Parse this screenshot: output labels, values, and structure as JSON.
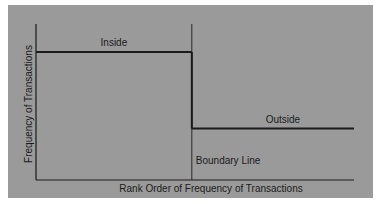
{
  "chart_data": {
    "type": "line",
    "style": "step",
    "title": "",
    "xlabel": "Rank Order of Frequency of Transactions",
    "ylabel": "Frequency of Transactions",
    "x_ticks": [],
    "y_ticks": [],
    "xlim": [
      0,
      1
    ],
    "ylim": [
      0,
      1
    ],
    "grid": false,
    "legend": null,
    "series": [
      {
        "name": "Transaction frequency",
        "points": [
          {
            "x": 0.0,
            "y": 0.82
          },
          {
            "x": 0.49,
            "y": 0.82
          },
          {
            "x": 0.49,
            "y": 0.33
          },
          {
            "x": 1.0,
            "y": 0.33
          }
        ]
      }
    ],
    "boundary": {
      "x": 0.49,
      "label": "Boundary Line"
    },
    "annotations": [
      {
        "text": "Inside",
        "region": "left"
      },
      {
        "text": "Outside",
        "region": "right"
      }
    ],
    "colors": {
      "background": "#9a9a9a",
      "line": "#1a1a1a"
    }
  }
}
